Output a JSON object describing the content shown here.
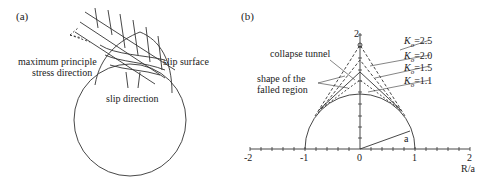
{
  "panel_a": {
    "label": "(a)",
    "annotations": {
      "max_stress_line1": "maximum principle",
      "max_stress_line2": "stress direction",
      "slip_surface": "slip surface",
      "slip_direction": "slip direction"
    }
  },
  "panel_b": {
    "label": "(b)",
    "annotations": {
      "collapse_tunnel": "collapse tunnel",
      "shape_line1": "shape of the",
      "shape_line2": "falled region",
      "radius": "a"
    },
    "legend": [
      {
        "k": "K",
        "sub": "o",
        "val": "=2.5"
      },
      {
        "k": "K",
        "sub": "o",
        "val": "=2.0"
      },
      {
        "k": "K",
        "sub": "o",
        "val": "=1.5"
      },
      {
        "k": "K",
        "sub": "o",
        "val": "=1.1"
      }
    ],
    "x_ticks": [
      "-2",
      "-1",
      "0",
      "1",
      "2"
    ],
    "y_tick": "2",
    "y_tick_1": "1",
    "x_axis_label": "R/a"
  }
}
